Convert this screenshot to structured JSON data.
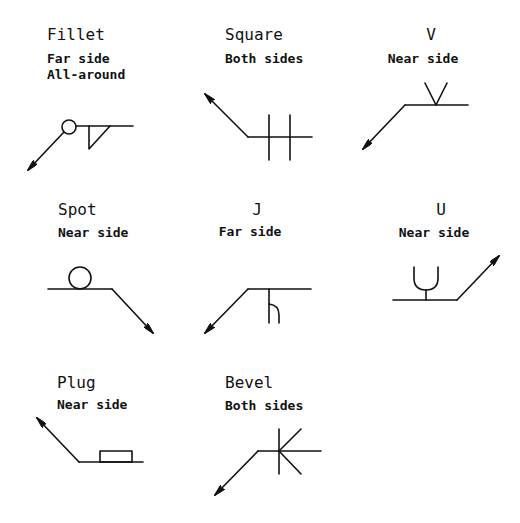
{
  "diagram": {
    "line_color": "#111111",
    "background": "#ffffff",
    "symbols": [
      {
        "id": "fillet",
        "title": "Fillet",
        "lines": [
          "Far side",
          "All-around"
        ]
      },
      {
        "id": "square",
        "title": "Square",
        "lines": [
          "Both sides"
        ]
      },
      {
        "id": "v",
        "title": "V",
        "lines": [
          "Near side"
        ]
      },
      {
        "id": "spot",
        "title": "Spot",
        "lines": [
          "Near side"
        ]
      },
      {
        "id": "j",
        "title": "J",
        "lines": [
          "Far side"
        ]
      },
      {
        "id": "u",
        "title": "U",
        "lines": [
          "Near side"
        ]
      },
      {
        "id": "plug",
        "title": "Plug",
        "lines": [
          "Near side"
        ]
      },
      {
        "id": "bevel",
        "title": "Bevel",
        "lines": [
          "Both sides"
        ]
      }
    ]
  }
}
